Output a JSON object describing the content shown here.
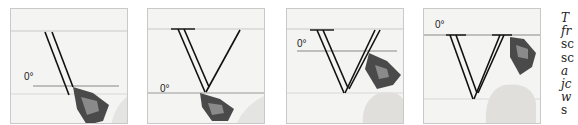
{
  "figure": {
    "panels": [
      {
        "id": 1,
        "angle_label": "0°",
        "description": "pen at start of left stroke of V, 0° line low"
      },
      {
        "id": 2,
        "angle_label": "0°",
        "description": "pen at bottom point of V"
      },
      {
        "id": 3,
        "angle_label": "0°",
        "description": "pen on right stroke of V"
      },
      {
        "id": 4,
        "angle_label": "0°",
        "description": "pen at top of right stroke, V complete"
      }
    ],
    "text_fragments": [
      {
        "text": "T",
        "style": "italic"
      },
      {
        "text": "fr",
        "style": "italic"
      },
      {
        "text": "sc",
        "style": "normal"
      },
      {
        "text": "sc",
        "style": "normal"
      },
      {
        "text": "a",
        "style": "italic"
      },
      {
        "text": "jc",
        "style": "italic"
      },
      {
        "text": "w",
        "style": "italic"
      },
      {
        "text": "s",
        "style": "normal"
      }
    ]
  }
}
